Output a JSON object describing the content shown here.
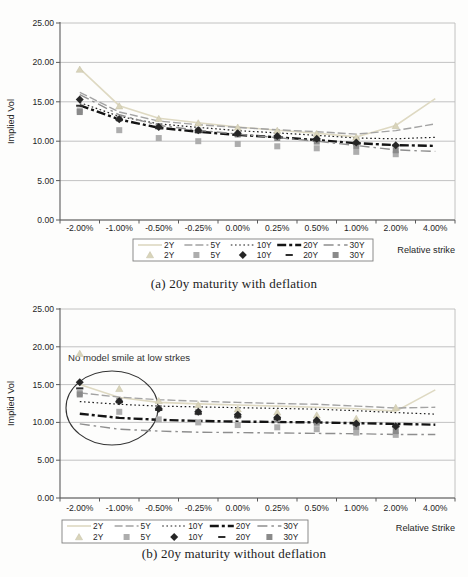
{
  "figure": {
    "caption_a": "(a) 20y maturity with deflation",
    "caption_b": "(b) 20y maturity without deflation"
  },
  "colors": {
    "background": "#fdfdfc",
    "gridline": "#bbbbbb",
    "axis": "#5a5a5a",
    "text": "#1f1f1f",
    "legend_border": "#7f7f7f",
    "annotation": "#333333"
  },
  "chart_data": [
    {
      "type": "line",
      "caption": "(a) 20y maturity with deflation",
      "ylabel": "Implied Vol",
      "xlabel": "Relative strike",
      "ylim": [
        0,
        25
      ],
      "yticks": [
        0,
        5,
        10,
        15,
        20,
        25
      ],
      "ytick_labels": [
        "0.00",
        "5.00",
        "10.00",
        "15.00",
        "20.00",
        "25.00"
      ],
      "grid": true,
      "legend_position": "bottom",
      "categories": [
        "-2.00%",
        "-1.00%",
        "-0.50%",
        "-0.25%",
        "0.00%",
        "0.25%",
        "0.50%",
        "1.00%",
        "2.00%",
        "4.00%"
      ],
      "line_series": [
        {
          "name": "2Y",
          "style": "solid",
          "color": "#ded9c2",
          "values": [
            19.2,
            14.5,
            12.9,
            12.35,
            11.8,
            11.4,
            11.0,
            10.55,
            12.0,
            15.4
          ]
        },
        {
          "name": "5Y",
          "style": "dash",
          "color": "#a3a3a3",
          "values": [
            16.2,
            13.7,
            12.55,
            12.1,
            11.75,
            11.45,
            11.2,
            10.9,
            11.35,
            12.2
          ]
        },
        {
          "name": "10Y",
          "style": "dot",
          "color": "#1c1c1c",
          "values": [
            14.9,
            13.15,
            12.2,
            11.75,
            11.35,
            11.05,
            10.75,
            10.4,
            10.3,
            10.5
          ]
        },
        {
          "name": "20Y",
          "style": "dashdot_bold",
          "color": "#141414",
          "values": [
            14.55,
            12.75,
            11.7,
            11.2,
            10.8,
            10.5,
            10.15,
            9.75,
            9.5,
            9.4
          ]
        },
        {
          "name": "30Y",
          "style": "dashdot",
          "color": "#8e8e8e",
          "values": [
            15.9,
            13.35,
            12.0,
            11.4,
            10.9,
            10.45,
            10.0,
            9.45,
            8.9,
            8.7
          ]
        }
      ],
      "marker_series": [
        {
          "name": "2Y",
          "marker": "triangle",
          "color": "#d9d4ba",
          "values": [
            19.1,
            14.45,
            12.85,
            12.3,
            11.75,
            11.35,
            10.95,
            10.5,
            11.95,
            null
          ]
        },
        {
          "name": "5Y",
          "marker": "square",
          "color": "#adadad",
          "values": [
            13.9,
            11.4,
            10.4,
            10.0,
            9.65,
            9.35,
            9.1,
            8.65,
            8.35,
            null
          ]
        },
        {
          "name": "30Y",
          "marker": "square",
          "color": "#8a8a8a",
          "values": [
            13.7,
            12.85,
            11.9,
            11.35,
            10.85,
            10.4,
            9.95,
            9.4,
            8.85,
            null
          ]
        },
        {
          "name": "20Y",
          "marker": "dash",
          "color": "#2e2e2e",
          "values": [
            14.5,
            12.7,
            11.65,
            11.15,
            10.75,
            10.45,
            10.1,
            9.7,
            9.45,
            null
          ]
        },
        {
          "name": "10Y",
          "marker": "diamond",
          "color": "#262626",
          "values": [
            15.3,
            12.8,
            11.8,
            11.4,
            11.0,
            10.65,
            10.3,
            9.85,
            9.5,
            null
          ]
        }
      ],
      "legend_row1": [
        "2Y",
        "5Y",
        "10Y",
        "20Y",
        "30Y"
      ],
      "legend_row2": [
        "2Y",
        "5Y",
        "10Y",
        "20Y",
        "30Y"
      ],
      "annotation": null
    },
    {
      "type": "line",
      "caption": "(b) 20y maturity without deflation",
      "ylabel": "Implied Vol",
      "xlabel": "Relative Strike",
      "ylim": [
        0,
        25
      ],
      "yticks": [
        0,
        5,
        10,
        15,
        20,
        25
      ],
      "ytick_labels": [
        "0.00",
        "5.00",
        "10.00",
        "15.00",
        "20.00",
        "25.00"
      ],
      "grid": true,
      "legend_position": "bottom",
      "categories": [
        "-2.00%",
        "-1.00%",
        "-0.50%",
        "-0.25%",
        "0.00%",
        "0.25%",
        "0.50%",
        "1.00%",
        "2.00%",
        "4.00%"
      ],
      "line_series": [
        {
          "name": "2Y",
          "style": "solid",
          "color": "#ded9c2",
          "values": [
            15.0,
            13.3,
            12.65,
            12.45,
            12.3,
            12.15,
            12.0,
            11.8,
            11.5,
            14.3
          ]
        },
        {
          "name": "5Y",
          "style": "dash",
          "color": "#a3a3a3",
          "values": [
            13.9,
            13.35,
            13.0,
            12.8,
            12.65,
            12.5,
            12.4,
            12.15,
            11.9,
            12.0
          ]
        },
        {
          "name": "10Y",
          "style": "dot",
          "color": "#1c1c1c",
          "values": [
            12.75,
            12.4,
            12.15,
            12.05,
            11.95,
            11.85,
            11.75,
            11.55,
            11.3,
            11.1
          ]
        },
        {
          "name": "20Y",
          "style": "dashdot_bold",
          "color": "#141414",
          "values": [
            11.15,
            10.6,
            10.35,
            10.2,
            10.1,
            10.05,
            10.0,
            9.9,
            9.8,
            9.7
          ]
        },
        {
          "name": "30Y",
          "style": "dashdot",
          "color": "#8e8e8e",
          "values": [
            9.8,
            9.1,
            8.85,
            8.7,
            8.65,
            8.6,
            8.55,
            8.5,
            8.4,
            8.4
          ]
        }
      ],
      "marker_series": [
        {
          "name": "2Y",
          "marker": "triangle",
          "color": "#d9d4ba",
          "values": [
            19.1,
            14.45,
            12.85,
            12.3,
            11.75,
            11.35,
            10.95,
            10.5,
            11.95,
            null
          ]
        },
        {
          "name": "5Y",
          "marker": "square",
          "color": "#adadad",
          "values": [
            13.9,
            11.4,
            10.4,
            10.0,
            9.65,
            9.35,
            9.1,
            8.65,
            8.35,
            null
          ]
        },
        {
          "name": "30Y",
          "marker": "square",
          "color": "#8a8a8a",
          "values": [
            13.7,
            12.85,
            11.9,
            11.35,
            10.85,
            10.4,
            9.95,
            9.4,
            8.85,
            null
          ]
        },
        {
          "name": "20Y",
          "marker": "dash",
          "color": "#2e2e2e",
          "values": [
            14.5,
            12.7,
            11.65,
            11.15,
            10.75,
            10.45,
            10.1,
            9.7,
            9.45,
            null
          ]
        },
        {
          "name": "10Y",
          "marker": "diamond",
          "color": "#262626",
          "values": [
            15.3,
            12.8,
            11.8,
            11.4,
            11.0,
            10.65,
            10.3,
            9.85,
            9.5,
            null
          ]
        }
      ],
      "legend_row1": [
        "2Y",
        "5Y",
        "10Y",
        "20Y",
        "30Y"
      ],
      "legend_row2": [
        "2Y",
        "5Y",
        "10Y",
        "20Y",
        "30Y"
      ],
      "annotation": {
        "text": "No model smile at low strkes",
        "circled_region": "low strikes cluster"
      }
    }
  ]
}
